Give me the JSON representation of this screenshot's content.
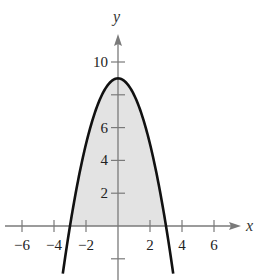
{
  "chart_data": {
    "type": "area",
    "title": "",
    "function": "y = 9 - x^2",
    "xlabel": "x",
    "ylabel": "y",
    "xlim": [
      -7,
      7.6
    ],
    "ylim": [
      -3.2,
      11.5
    ],
    "xticks": [
      -6,
      -4,
      -2,
      2,
      4,
      6
    ],
    "xtick_labels": [
      "−6",
      "−4",
      "−2",
      "2",
      "4",
      "6"
    ],
    "yticks": [
      -2,
      2,
      4,
      6,
      8,
      10
    ],
    "ytick_labels": [
      "",
      "2",
      "4",
      "6",
      "",
      "10"
    ],
    "grid": false,
    "legend": null,
    "shaded_region": "area between y = 9 - x^2 and the x-axis for -3 <= x <= 3",
    "x": [
      -3.45,
      -3,
      -2,
      -1,
      0,
      1,
      2,
      3,
      3.45
    ],
    "values": [
      -2.9,
      0,
      5,
      8,
      9,
      8,
      5,
      0,
      -2.9
    ],
    "vertex": [
      0,
      9
    ],
    "roots": [
      -3,
      3
    ],
    "colors": {
      "curve": "#111111",
      "fill": "#e3e3e3",
      "axes": "#7a7a7a",
      "text": "#222222"
    }
  }
}
